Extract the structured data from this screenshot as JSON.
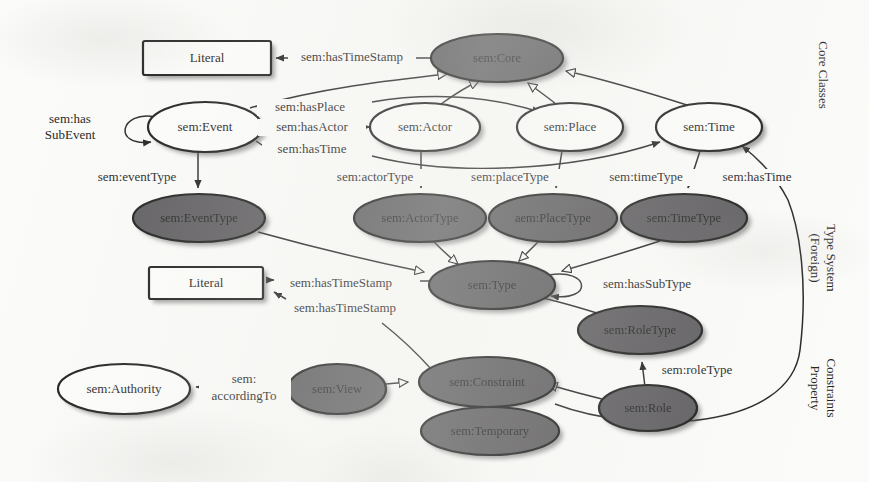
{
  "figure": {
    "background_color": "#fbfbf9",
    "node_dark_color": "#555356",
    "node_light_color": "#fdfdfb",
    "stroke_color": "#111111"
  },
  "sections": [
    {
      "id": "core-classes",
      "label": "Core Classes"
    },
    {
      "id": "type-system",
      "label": "(Foreign)\nType System",
      "line1": "(Foreign)",
      "line2": "Type System"
    },
    {
      "id": "property-constraints",
      "label": "Property\nConstraints",
      "line1": "Property",
      "line2": "Constraints"
    }
  ],
  "nodes": [
    {
      "id": "literal-top",
      "label": "Literal",
      "shape": "rect",
      "fill": "light",
      "cx": 206,
      "cy": 58,
      "rx": 64,
      "ry": 17
    },
    {
      "id": "core",
      "label": "sem:Core",
      "shape": "ellipse",
      "fill": "dark",
      "cx": 497,
      "cy": 58,
      "rx": 66,
      "ry": 24
    },
    {
      "id": "event",
      "label": "sem:Event",
      "shape": "ellipse",
      "fill": "light",
      "cx": 205,
      "cy": 127,
      "rx": 57,
      "ry": 25
    },
    {
      "id": "actor",
      "label": "sem:Actor",
      "shape": "ellipse",
      "fill": "light",
      "cx": 425,
      "cy": 127,
      "rx": 55,
      "ry": 24
    },
    {
      "id": "place",
      "label": "sem:Place",
      "shape": "ellipse",
      "fill": "light",
      "cx": 570,
      "cy": 127,
      "rx": 53,
      "ry": 24
    },
    {
      "id": "time",
      "label": "sem:Time",
      "shape": "ellipse",
      "fill": "light",
      "cx": 709,
      "cy": 127,
      "rx": 53,
      "ry": 24
    },
    {
      "id": "event-type",
      "label": "sem:EventType",
      "shape": "ellipse",
      "fill": "dark",
      "cx": 199,
      "cy": 218,
      "rx": 66,
      "ry": 24
    },
    {
      "id": "actor-type",
      "label": "sem:ActorType",
      "shape": "ellipse",
      "fill": "dark",
      "cx": 420,
      "cy": 218,
      "rx": 66,
      "ry": 24
    },
    {
      "id": "place-type",
      "label": "aem:PlaceType",
      "shape": "ellipse",
      "fill": "dark",
      "cx": 553,
      "cy": 218,
      "rx": 64,
      "ry": 24
    },
    {
      "id": "time-type",
      "label": "sem:TimeType",
      "shape": "ellipse",
      "fill": "dark",
      "cx": 684,
      "cy": 218,
      "rx": 63,
      "ry": 24
    },
    {
      "id": "literal-mid",
      "label": "Literal",
      "shape": "rect",
      "fill": "light",
      "cx": 206,
      "cy": 284,
      "rx": 57,
      "ry": 17
    },
    {
      "id": "type",
      "label": "sem:Type",
      "shape": "ellipse",
      "fill": "dark",
      "cx": 492,
      "cy": 285,
      "rx": 63,
      "ry": 24
    },
    {
      "id": "role-type",
      "label": "sem:RoleType",
      "shape": "ellipse",
      "fill": "dark",
      "cx": 640,
      "cy": 330,
      "rx": 62,
      "ry": 24
    },
    {
      "id": "constraint",
      "label": "sem:Constraint",
      "shape": "ellipse",
      "fill": "dark",
      "cx": 487,
      "cy": 382,
      "rx": 68,
      "ry": 25
    },
    {
      "id": "view",
      "label": "sem:View",
      "shape": "ellipse",
      "fill": "dark",
      "cx": 337,
      "cy": 389,
      "rx": 49,
      "ry": 25
    },
    {
      "id": "authority",
      "label": "sem:Authority",
      "shape": "ellipse",
      "fill": "light",
      "cx": 124,
      "cy": 389,
      "rx": 66,
      "ry": 25
    },
    {
      "id": "role",
      "label": "sem:Role",
      "shape": "ellipse",
      "fill": "dark",
      "cx": 648,
      "cy": 408,
      "rx": 49,
      "ry": 23
    },
    {
      "id": "temporary",
      "label": "sem:Temporary",
      "shape": "ellipse",
      "fill": "dark",
      "cx": 490,
      "cy": 431,
      "rx": 69,
      "ry": 24
    }
  ],
  "edges": [
    {
      "id": "core-hastimestamp-literal",
      "label": "sem:hasTimeStamp",
      "from": "core",
      "to": "literal-top",
      "arrow": "filled",
      "lx": 352,
      "ly": 58
    },
    {
      "id": "event-subclass-core",
      "label": "",
      "from": "event",
      "to": "core",
      "arrow": "hollow"
    },
    {
      "id": "actor-subclass-core",
      "label": "",
      "from": "actor",
      "to": "core",
      "arrow": "hollow"
    },
    {
      "id": "place-subclass-core",
      "label": "",
      "from": "place",
      "to": "core",
      "arrow": "hollow"
    },
    {
      "id": "time-subclass-core",
      "label": "",
      "from": "time",
      "to": "core",
      "arrow": "hollow"
    },
    {
      "id": "event-hassubevent-event",
      "label": "sem:has\nSubEvent",
      "line1": "sem:has",
      "line2": "SubEvent",
      "from": "event",
      "to": "event",
      "arrow": "filled",
      "lx": 70,
      "ly": 121
    },
    {
      "id": "event-hasplace-place",
      "label": "sem:hasPlace",
      "from": "event",
      "to": "place",
      "arrow": "filled",
      "lx": 310,
      "ly": 108
    },
    {
      "id": "event-hasactor-actor",
      "label": "sem:hasActor",
      "from": "event",
      "to": "actor",
      "arrow": "filled",
      "lx": 312,
      "ly": 128
    },
    {
      "id": "event-hastime-time",
      "label": "sem:hasTime",
      "from": "event",
      "to": "time",
      "arrow": "filled",
      "lx": 312,
      "ly": 150
    },
    {
      "id": "event-eventtype",
      "label": "sem:eventType",
      "from": "event",
      "to": "event-type",
      "arrow": "filled",
      "lx": 137,
      "ly": 178
    },
    {
      "id": "actor-actortype",
      "label": "sem:actorType",
      "from": "actor",
      "to": "actor-type",
      "arrow": "filled",
      "lx": 375,
      "ly": 178
    },
    {
      "id": "place-placetype",
      "label": "sem:placeType",
      "from": "place",
      "to": "place-type",
      "arrow": "filled",
      "lx": 510,
      "ly": 178
    },
    {
      "id": "time-timetype",
      "label": "sem:timeType",
      "from": "time",
      "to": "time-type",
      "arrow": "filled",
      "lx": 646,
      "ly": 178
    },
    {
      "id": "constraint-hastime-time",
      "label": "sem:hasTime",
      "from": "constraint",
      "to": "time",
      "arrow": "filled",
      "lx": 757,
      "ly": 178
    },
    {
      "id": "eventtype-subclass-type",
      "label": "",
      "from": "event-type",
      "to": "type",
      "arrow": "hollow"
    },
    {
      "id": "actortype-subclass-type",
      "label": "",
      "from": "actor-type",
      "to": "type",
      "arrow": "hollow"
    },
    {
      "id": "placetype-subclass-type",
      "label": "",
      "from": "place-type",
      "to": "type",
      "arrow": "hollow"
    },
    {
      "id": "timetype-subclass-type",
      "label": "",
      "from": "time-type",
      "to": "type",
      "arrow": "hollow"
    },
    {
      "id": "type-hastimestamp-literal",
      "label": "sem:hasTimeStamp",
      "from": "type",
      "to": "literal-mid",
      "arrow": "filled",
      "lx": 341,
      "ly": 284
    },
    {
      "id": "constraint-hastimestamp-literal",
      "label": "sem:hasTimeStamp",
      "from": "constraint",
      "to": "literal-mid",
      "arrow": "filled",
      "lx": 345,
      "ly": 309
    },
    {
      "id": "type-hassubtype-type",
      "label": "sem:hasSubType",
      "from": "type",
      "to": "type",
      "arrow": "filled",
      "lx": 647,
      "ly": 285
    },
    {
      "id": "roletype-subclass-type",
      "label": "",
      "from": "role-type",
      "to": "type",
      "arrow": "hollow"
    },
    {
      "id": "role-roletype",
      "label": "sem:roleType",
      "from": "role",
      "to": "role-type",
      "arrow": "filled",
      "lx": 697,
      "ly": 371
    },
    {
      "id": "view-subclass-constraint",
      "label": "",
      "from": "view",
      "to": "constraint",
      "arrow": "hollow"
    },
    {
      "id": "role-subclass-constraint",
      "label": "",
      "from": "role",
      "to": "constraint",
      "arrow": "hollow"
    },
    {
      "id": "temporary-subclass-constraint",
      "label": "",
      "from": "temporary",
      "to": "constraint",
      "arrow": "hollow"
    },
    {
      "id": "view-accordingto-authority",
      "label": "sem:\naccordingTo",
      "line1": "sem:",
      "line2": "accordingTo",
      "from": "view",
      "to": "authority",
      "arrow": "filled",
      "lx": 244,
      "ly": 389
    }
  ]
}
